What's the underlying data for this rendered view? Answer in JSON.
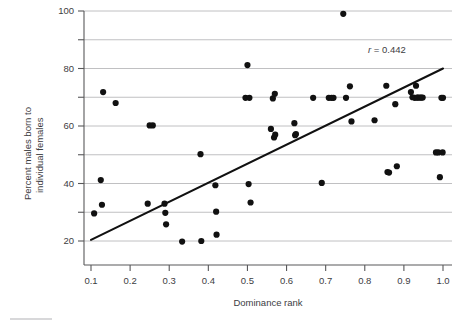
{
  "chart_data": {
    "type": "scatter",
    "title": "",
    "xlabel": "Dominance rank",
    "ylabel": "Percent males born to individual females",
    "ylabel_line1": "Percent males born to",
    "ylabel_line2": "individual females",
    "xlim": [
      0.055,
      1.045
    ],
    "ylim": [
      14,
      100
    ],
    "xticks": [
      0.1,
      0.2,
      0.3,
      0.4,
      0.5,
      0.6,
      0.7,
      0.8,
      0.9,
      1.0
    ],
    "xticklabels": [
      "0.1",
      "0.2",
      "0.3",
      "0.4",
      "0.5",
      "0.6",
      "0.7",
      "0.8",
      "0.9",
      "1.0"
    ],
    "yticks": [
      20,
      30,
      40,
      50,
      60,
      70,
      80,
      90,
      100
    ],
    "yticklabels": [
      "20",
      "",
      "40",
      "",
      "60",
      "",
      "80",
      "",
      "100"
    ],
    "ylabels_shown": [
      "20",
      "40",
      "60",
      "80",
      "100"
    ],
    "gridlines_y": [
      20,
      30,
      40,
      50,
      60,
      70,
      80,
      90,
      100
    ],
    "grid": "horizontal",
    "legend": "none",
    "annotation": {
      "symbol": "r",
      "equals": " = ",
      "value": "0.442",
      "full_text": "r = 0.442",
      "x": 0.905,
      "y": 85.5
    },
    "fit_line": {
      "x0": 0.1,
      "y0": 20.4,
      "x1": 1.0,
      "y1": 80.0,
      "slope": 66.2,
      "intercept": 13.8,
      "color": "#111111"
    },
    "marker": {
      "shape": "circle",
      "radius_px": 3.1,
      "color": "#111111"
    },
    "n_points": 60,
    "x": [
      0.108,
      0.125,
      0.128,
      0.131,
      0.163,
      0.245,
      0.25,
      0.258,
      0.288,
      0.29,
      0.292,
      0.333,
      0.38,
      0.382,
      0.418,
      0.42,
      0.421,
      0.495,
      0.5,
      0.503,
      0.505,
      0.508,
      0.56,
      0.565,
      0.568,
      0.57,
      0.571,
      0.62,
      0.622,
      0.624,
      0.668,
      0.69,
      0.708,
      0.715,
      0.72,
      0.745,
      0.752,
      0.762,
      0.766,
      0.825,
      0.855,
      0.858,
      0.862,
      0.878,
      0.882,
      0.918,
      0.922,
      0.928,
      0.931,
      0.934,
      0.936,
      0.941,
      0.944,
      0.948,
      0.982,
      0.988,
      0.992,
      0.996,
      0.999,
      1.0
    ],
    "y": [
      29.6,
      41.2,
      32.6,
      71.8,
      68.0,
      33.0,
      60.2,
      60.2,
      33.0,
      29.8,
      25.8,
      19.8,
      50.2,
      20.0,
      39.4,
      30.2,
      22.2,
      69.8,
      81.2,
      39.8,
      69.8,
      33.4,
      59.0,
      69.6,
      56.0,
      71.2,
      57.0,
      61.0,
      56.8,
      57.2,
      69.8,
      40.2,
      69.8,
      69.8,
      69.8,
      99.0,
      69.8,
      73.8,
      61.6,
      62.0,
      74.0,
      44.0,
      43.8,
      67.6,
      46.0,
      71.8,
      70.0,
      69.8,
      74.0,
      69.9,
      69.9,
      69.9,
      69.9,
      69.9,
      50.8,
      50.8,
      42.2,
      69.8,
      50.8,
      69.8
    ]
  },
  "axes": {
    "x_axis_name": "dominance-rank-axis",
    "y_axis_name": "percent-males-axis"
  }
}
